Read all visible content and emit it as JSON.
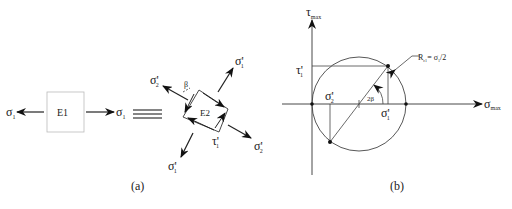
{
  "panel_a": {
    "caption": "(a)",
    "element1": {
      "label": "E1",
      "sigma_left": "σ",
      "sigma_left_sub": "1",
      "sigma_right": "σ",
      "sigma_right_sub": "1"
    },
    "equivalence_symbol": "≡",
    "element2": {
      "label": "E2",
      "beta": "β",
      "sigma_top_left": "σ'",
      "sigma_top_left_sub": "2",
      "sigma_top_right": "σ'",
      "sigma_top_right_sub": "1",
      "sigma_bottom_right": "σ'",
      "sigma_bottom_right_sub": "2",
      "sigma_bottom_left": "σ'",
      "sigma_bottom_left_sub": "1",
      "tau": "τ'",
      "tau_sub": "1"
    }
  },
  "panel_b": {
    "caption": "(b)",
    "y_axis_label": "τ",
    "y_axis_sub": "max",
    "x_axis_label": "σ",
    "x_axis_sub": "max",
    "tau_point": "τ'",
    "tau_point_sub": "1",
    "sigma2_point": "σ'",
    "sigma2_point_sub": "2",
    "sigma1_point": "σ'",
    "sigma1_point_sub": "1",
    "angle_label": "2β",
    "radius_label": "R",
    "radius_sub": "c1",
    "radius_eq": "= σ",
    "radius_eq_sub": "1",
    "radius_tail": "/2"
  }
}
